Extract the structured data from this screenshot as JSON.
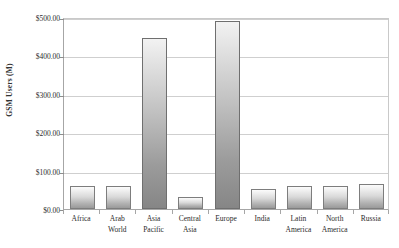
{
  "chart_data": {
    "type": "bar",
    "title": "",
    "xlabel": "",
    "ylabel": "GSM Users (M)",
    "ylim": [
      0,
      500
    ],
    "grid": true,
    "legend": "none",
    "y_tick_labels": [
      "$500.00",
      "$400.00",
      "$300.00",
      "$200.00",
      "$100.00",
      "$0.00"
    ],
    "y_tick_values": [
      500,
      400,
      300,
      200,
      100,
      0
    ],
    "categories": [
      "Africa",
      "Arab World",
      "Asia Pacific",
      "Central Asia",
      "Europe",
      "India",
      "Latin America",
      "North America",
      "Russia"
    ],
    "category_lines": [
      [
        "Africa",
        ""
      ],
      [
        "Arab",
        "World"
      ],
      [
        "Asia",
        "Pacific"
      ],
      [
        "Central",
        "Asia"
      ],
      [
        "Europe",
        ""
      ],
      [
        "India",
        ""
      ],
      [
        "Latin",
        "America"
      ],
      [
        "North",
        "America"
      ],
      [
        "Russia",
        ""
      ]
    ],
    "values": [
      61,
      60,
      446,
      31,
      489,
      52,
      59,
      60,
      64
    ],
    "series": [
      {
        "name": "GSM Users (M)",
        "values": [
          61,
          60,
          446,
          31,
          489,
          52,
          59,
          60,
          64
        ]
      }
    ],
    "colors": {
      "bar_top": "#fbfbfb",
      "bar_bottom": "#9a9a9a",
      "bar_border": "#7d7d7d",
      "gridline": "#cfcfcf",
      "axis": "#a6a6a6",
      "text": "#2b2b2b",
      "background": "#ffffff"
    }
  }
}
